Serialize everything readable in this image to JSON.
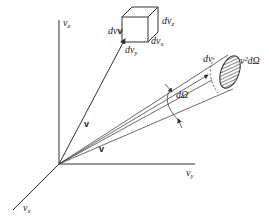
{
  "diagram": {
    "axes": {
      "vz": {
        "label": "v",
        "sub": "z"
      },
      "vy": {
        "label": "v",
        "sub": "y"
      },
      "vx": {
        "label": "v",
        "sub": "x"
      }
    },
    "cube": {
      "volume_label": "dv",
      "volume_label_bold": "v",
      "edge_x": {
        "label": "dv",
        "sub": "x"
      },
      "edge_y": {
        "label": "dv",
        "sub": "y"
      },
      "edge_z": {
        "label": "dv",
        "sub": "z"
      }
    },
    "vectors": {
      "to_cube": "v",
      "to_cone": "v"
    },
    "cone": {
      "solid_angle_label": "dΩ",
      "length_label": "dv",
      "area_label": "v²dΩ"
    },
    "colors": {
      "line": "#333333",
      "background": "#ffffff"
    }
  }
}
